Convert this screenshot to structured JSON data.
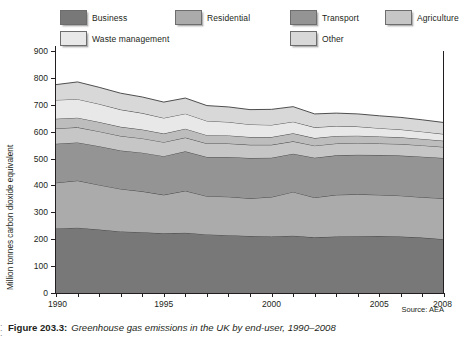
{
  "legend": {
    "items": [
      {
        "label": "Business",
        "color": "#787878",
        "x": 0,
        "y": 0
      },
      {
        "label": "Residential",
        "color": "#ababab",
        "x": 115,
        "y": 0
      },
      {
        "label": "Transport",
        "color": "#949494",
        "x": 230,
        "y": 0
      },
      {
        "label": "Agriculture",
        "color": "#c6c6c6",
        "x": 325,
        "y": 0
      },
      {
        "label": "Public",
        "color": "#bdbdbd",
        "x": 420,
        "y": 0
      },
      {
        "label": "Waste management",
        "color": "#e8e8e8",
        "x": 0,
        "y": 21
      },
      {
        "label": "Other",
        "color": "#d8d8d8",
        "x": 230,
        "y": 21
      }
    ]
  },
  "source": "Source: AEA",
  "caption": {
    "number": "Figure 203.3:",
    "text": "Greenhouse gas emissions in the UK by end-user, 1990–2008"
  },
  "chart_data": {
    "type": "area",
    "title": "Greenhouse gas emissions in the UK by end-user, 1990–2008",
    "xlabel": "",
    "ylabel": "Million tonnes carbon dioxide equivalent",
    "xlim": [
      1990,
      2008
    ],
    "ylim": [
      0,
      900
    ],
    "yticks": [
      0,
      100,
      200,
      300,
      400,
      500,
      600,
      700,
      800,
      900
    ],
    "ytick_labels": [
      "0",
      "100",
      "200",
      "300",
      "400",
      "500",
      "600",
      "700",
      "800",
      "900"
    ],
    "xticks": [
      1990,
      1991,
      1992,
      1993,
      1994,
      1995,
      1996,
      1997,
      1998,
      1999,
      2000,
      2001,
      2002,
      2003,
      2004,
      2005,
      2006,
      2007,
      2008
    ],
    "xtick_labels_shown": [
      "1990",
      "1995",
      "2000",
      "2005",
      "2008"
    ],
    "grid": false,
    "legend_position": "top",
    "stacked": true,
    "x": [
      1990,
      1991,
      1992,
      1993,
      1994,
      1995,
      1996,
      1997,
      1998,
      1999,
      2000,
      2001,
      2002,
      2003,
      2004,
      2005,
      2006,
      2007,
      2008
    ],
    "series": [
      {
        "name": "Business",
        "color": "#787878",
        "values": [
          240,
          243,
          236,
          229,
          226,
          222,
          224,
          218,
          215,
          212,
          210,
          213,
          207,
          210,
          211,
          212,
          210,
          206,
          200
        ]
      },
      {
        "name": "Residential",
        "color": "#ababab",
        "values": [
          170,
          175,
          166,
          158,
          152,
          143,
          156,
          142,
          143,
          140,
          147,
          163,
          148,
          155,
          156,
          153,
          152,
          150,
          152
        ]
      },
      {
        "name": "Transport",
        "color": "#949494",
        "values": [
          145,
          142,
          144,
          143,
          144,
          144,
          147,
          146,
          148,
          150,
          146,
          142,
          148,
          147,
          147,
          148,
          149,
          151,
          150
        ]
      },
      {
        "name": "Agriculture",
        "color": "#c6c6c6",
        "values": [
          57,
          56,
          55,
          54,
          53,
          52,
          51,
          50,
          50,
          49,
          48,
          46,
          45,
          44,
          44,
          43,
          43,
          42,
          41
        ]
      },
      {
        "name": "Public",
        "color": "#bdbdbd",
        "values": [
          36,
          36,
          35,
          34,
          33,
          32,
          33,
          31,
          30,
          29,
          29,
          30,
          28,
          28,
          27,
          26,
          25,
          24,
          23
        ]
      },
      {
        "name": "Waste management",
        "color": "#e8e8e8",
        "values": [
          70,
          69,
          67,
          64,
          61,
          58,
          56,
          53,
          50,
          47,
          45,
          43,
          40,
          37,
          34,
          31,
          29,
          27,
          25
        ]
      },
      {
        "name": "Other",
        "color": "#d8d8d8",
        "values": [
          57,
          64,
          62,
          61,
          60,
          59,
          58,
          57,
          56,
          55,
          58,
          56,
          50,
          48,
          47,
          46,
          45,
          44,
          43
        ]
      }
    ]
  }
}
